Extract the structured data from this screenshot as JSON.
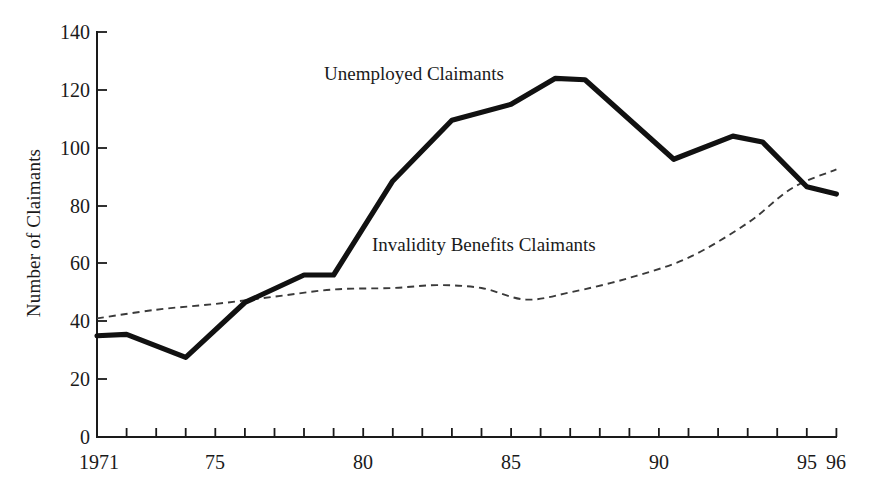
{
  "chart_data": {
    "type": "line",
    "title": "",
    "xlabel": "",
    "ylabel": "Number of Claimants",
    "xlim": [
      1971,
      1996
    ],
    "ylim": [
      0,
      140
    ],
    "ytick_values": [
      0,
      20,
      40,
      60,
      80,
      100,
      120,
      140
    ],
    "ytick_labels": [
      "0",
      "20",
      "40",
      "60",
      "80",
      "100",
      "120",
      "140"
    ],
    "xtick_values": [
      1971,
      1972,
      1973,
      1974,
      1975,
      1976,
      1977,
      1978,
      1979,
      1980,
      1981,
      1982,
      1983,
      1984,
      1985,
      1986,
      1987,
      1988,
      1989,
      1990,
      1991,
      1992,
      1993,
      1994,
      1995,
      1996
    ],
    "xtick_labels_shown": [
      {
        "value": 1971,
        "label": "1971"
      },
      {
        "value": 1975,
        "label": "75"
      },
      {
        "value": 1980,
        "label": "80"
      },
      {
        "value": 1985,
        "label": "85"
      },
      {
        "value": 1990,
        "label": "90"
      },
      {
        "value": 1995,
        "label": "95"
      },
      {
        "value": 1996,
        "label": "96"
      }
    ],
    "grid": false,
    "legend_position": "inline-annotations",
    "series": [
      {
        "name": "Unemployed Claimants",
        "style": "solid-thick",
        "color": "#111111",
        "x": [
          1971,
          1972,
          1974,
          1976,
          1978,
          1979,
          1981,
          1983,
          1985,
          1986.5,
          1987.5,
          1990.5,
          1992.5,
          1993.5,
          1995,
          1996
        ],
        "values": [
          35,
          35.5,
          27.5,
          46.5,
          56,
          56,
          88.5,
          109.5,
          115,
          124,
          123.5,
          96,
          104,
          102,
          86.5,
          84
        ]
      },
      {
        "name": "Invalidity Benefits Claimants",
        "style": "dashed-thin",
        "color": "#3a3a3a",
        "x": [
          1971,
          1973,
          1975,
          1977,
          1979,
          1981,
          1982.5,
          1984,
          1985.5,
          1987,
          1989,
          1991,
          1993,
          1994.5,
          1996
        ],
        "values": [
          41,
          44,
          46,
          48.5,
          51,
          51.5,
          52.5,
          51.5,
          47.5,
          50,
          55,
          62,
          74,
          86,
          92.5
        ]
      }
    ],
    "annotations": [
      {
        "name": "unemployed-claimants-label",
        "text": "Unemployed Claimants"
      },
      {
        "name": "invalidity-benefits-claimants-label",
        "text": "Invalidity Benefits Claimants"
      }
    ]
  },
  "labels": {
    "y_axis_title": "Number of Claimants",
    "series_unemployed": "Unemployed Claimants",
    "series_invalidity": "Invalidity Benefits Claimants",
    "y0": "0",
    "y20": "20",
    "y40": "40",
    "y60": "60",
    "y80": "80",
    "y100": "100",
    "y120": "120",
    "y140": "140",
    "x1971": "1971",
    "x75": "75",
    "x80": "80",
    "x85": "85",
    "x90": "90",
    "x95": "95",
    "x96": "96"
  },
  "colors": {
    "background": "#ffffff",
    "ink": "#1a1a1a",
    "solid_series": "#111111",
    "dashed_series": "#3a3a3a"
  }
}
